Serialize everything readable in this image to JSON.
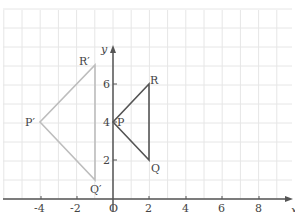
{
  "diagram": {
    "type": "coordinate_plane_transformation",
    "axes": {
      "x_label": "x",
      "y_label": "y",
      "origin_label": "O",
      "x_ticks": [
        "-4",
        "-2",
        "2",
        "4",
        "6",
        "8"
      ],
      "y_ticks": [
        "2",
        "4",
        "6"
      ],
      "x_range": [
        -6,
        10
      ],
      "y_range": [
        0,
        10
      ]
    },
    "grid": {
      "on": true,
      "spacing": 1,
      "color": "#e6e6e6"
    },
    "shapes": [
      {
        "name": "triangle-PQR",
        "color": "#555555",
        "vertices": [
          {
            "label": "P",
            "x": 0,
            "y": 4
          },
          {
            "label": "Q",
            "x": 2,
            "y": 2
          },
          {
            "label": "R",
            "x": 2,
            "y": 6
          }
        ]
      },
      {
        "name": "triangle-P'Q'R'",
        "color": "#bbbbbb",
        "vertices": [
          {
            "label": "P′",
            "x": -4,
            "y": 4
          },
          {
            "label": "Q′",
            "x": -1,
            "y": 1
          },
          {
            "label": "R′",
            "x": -1,
            "y": 7
          }
        ]
      }
    ]
  }
}
